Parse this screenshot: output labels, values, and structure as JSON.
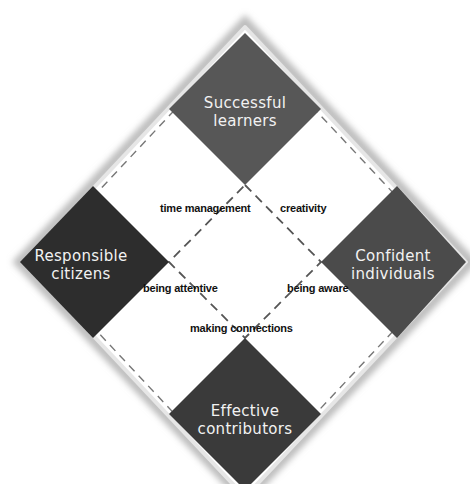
{
  "diagram": {
    "center": [
      245,
      262
    ],
    "outer_half_diagonal": 228,
    "tile_half_diagonal": 76,
    "colors": {
      "frame": "#d9d9d9",
      "frame_shadow": "#bdbdbd",
      "background": "#ffffff",
      "dash": "#666666",
      "successful": "#575757",
      "responsible": "#2d2d2d",
      "confident": "#4b4b4b",
      "effective": "#3a3a3a"
    },
    "tiles": {
      "top": {
        "line1": "Successful",
        "line2": "learners"
      },
      "left": {
        "line1": "Responsible",
        "line2": "citizens"
      },
      "right": {
        "line1": "Confident",
        "line2": "individuals"
      },
      "bottom": {
        "line1": "Effective",
        "line2": "contributors"
      }
    },
    "skills": {
      "time_management": "time management",
      "creativity": "creativity",
      "being_attentive": "being attentive",
      "being_aware": "being aware",
      "making_connections": "making connections"
    }
  }
}
